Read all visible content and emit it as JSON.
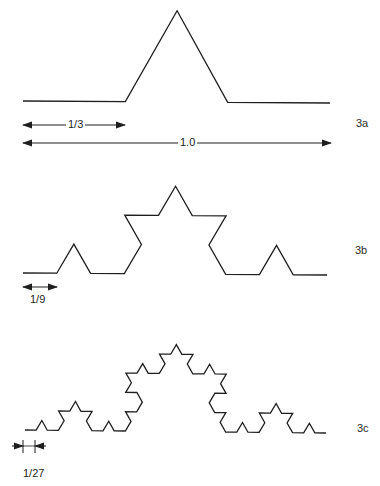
{
  "diagram": {
    "stroke_color": "#1e1e1e",
    "stroke_width": 1.3,
    "figures": [
      {
        "id": "3a",
        "label": "3a",
        "iterations": 1,
        "start": [
          23,
          101
        ],
        "end": [
          330,
          103
        ],
        "peak_height_scale": 1.03,
        "label_pos": [
          356,
          118
        ]
      },
      {
        "id": "3b",
        "label": "3b",
        "iterations": 2,
        "start": [
          23,
          273
        ],
        "end": [
          327,
          275
        ],
        "peak_height_scale": 1.0,
        "label_pos": [
          355,
          245
        ]
      },
      {
        "id": "3c",
        "label": "3c",
        "iterations": 3,
        "start": [
          25,
          430
        ],
        "end": [
          326,
          433
        ],
        "peak_height_scale": 1.0,
        "label_pos": [
          357,
          423
        ]
      }
    ],
    "dimensions": {
      "one_third": {
        "label": "1/3",
        "x1": 23,
        "x2": 125,
        "y": 125,
        "label_x": 66,
        "label_y": 119
      },
      "one": {
        "label": "1.0",
        "x1": 23,
        "x2": 331,
        "y": 143,
        "label_x": 178,
        "label_y": 137
      },
      "one_ninth": {
        "label": "1/9",
        "x1": 23,
        "x2": 57,
        "y": 287,
        "label_x": 28,
        "label_y": 294
      },
      "one_twentyseventh": {
        "label": "1/27",
        "tick_x1": 23,
        "tick_x2": 35,
        "y": 446,
        "tick_top": 440,
        "tick_bottom": 453,
        "outer_left": 12,
        "outer_right": 46,
        "label_x": 21,
        "label_y": 468
      }
    }
  }
}
